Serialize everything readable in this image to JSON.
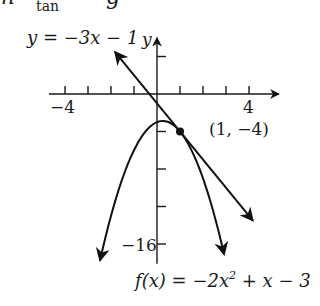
{
  "header_fragment": {
    "text": "m",
    "subscript": "tan",
    "trailing": "g"
  },
  "chart_data": {
    "type": "line",
    "title": "",
    "xlabel": "",
    "ylabel": "y",
    "xlim": [
      -4.7,
      5.3
    ],
    "ylim": [
      -18.1,
      6.0
    ],
    "grid": false,
    "x_ticks": [
      -4,
      -3,
      -2,
      -1,
      1,
      2,
      3,
      4
    ],
    "x_tick_labels": [
      {
        "x": -4,
        "label": "−4"
      },
      {
        "x": 4,
        "label": "4"
      }
    ],
    "y_ticks": [
      4,
      -4,
      -8,
      -12,
      -16
    ],
    "y_tick_labels": [
      {
        "y": -16,
        "label": "−16"
      }
    ],
    "series": [
      {
        "name": "f(x) = −2x² + x − 3",
        "kind": "parabola",
        "coefficients": {
          "a": -2,
          "b": 1,
          "c": -3
        },
        "x_range": [
          -2.48,
          2.92
        ],
        "arrows": "both"
      },
      {
        "name": "y = −3x − 1",
        "kind": "tangent-line",
        "coefficients": {
          "m": -3,
          "b": -1
        },
        "x_range": [
          -1.83,
          4.17
        ],
        "arrows": "both"
      }
    ],
    "points": [
      {
        "x": 1,
        "y": -4,
        "label": "(1, −4)"
      }
    ],
    "annotations": {
      "tangent_label": "y = −3x − 1",
      "curve_label_prefix": "f(x) = −2x",
      "curve_label_exp": "2",
      "curve_label_suffix": " + x − 3"
    }
  }
}
